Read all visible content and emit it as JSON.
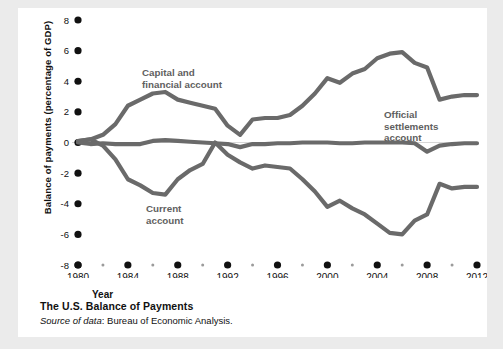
{
  "figure": {
    "caption_title": "The U.S. Balance of Payments",
    "source_lead": "Source of data",
    "source_text": ": Bureau of Economic Analysis."
  },
  "colors": {
    "line": "#6a6a6a",
    "zero_line": "#d7d7d7",
    "text": "#111111",
    "label": "#5f5f5f",
    "page_background": "#ebebeb",
    "card_background": "#ffffff"
  },
  "chart_data": {
    "type": "line",
    "title": "The U.S. Balance of Payments",
    "xlabel": "Year",
    "ylabel": "Balance of payments (percentage of GDP)",
    "xlim": [
      1980,
      2012
    ],
    "ylim": [
      -8,
      8
    ],
    "yticks": [
      8,
      6,
      4,
      2,
      0,
      -2,
      -4,
      -6,
      -8
    ],
    "ytick_labels": [
      "8",
      "6",
      "4",
      "2",
      "0",
      "-2",
      "-4",
      "-6",
      "-8"
    ],
    "xticks": [
      1980,
      1984,
      1988,
      1992,
      1996,
      2000,
      2004,
      2008,
      2012
    ],
    "xtick_labels": [
      "1980",
      "1984",
      "1988",
      "1992",
      "1996",
      "2000",
      "2004",
      "2008",
      "2012"
    ],
    "minor_xticks": [
      1982,
      1986,
      1990,
      1994,
      1998,
      2002,
      2006,
      2010
    ],
    "grid": false,
    "legend": "inline-annotations",
    "x": [
      1980,
      1981,
      1982,
      1983,
      1984,
      1985,
      1986,
      1987,
      1988,
      1989,
      1990,
      1991,
      1992,
      1993,
      1994,
      1995,
      1996,
      1997,
      1998,
      1999,
      2000,
      2001,
      2002,
      2003,
      2004,
      2005,
      2006,
      2007,
      2008,
      2009,
      2010,
      2011,
      2012
    ],
    "series": [
      {
        "name": "Capital and financial account",
        "label_lines": [
          "Capital and",
          "financial account"
        ],
        "values": [
          0.1,
          0.2,
          0.5,
          1.2,
          2.4,
          2.8,
          3.2,
          3.3,
          2.8,
          2.6,
          2.4,
          2.2,
          1.1,
          0.5,
          1.5,
          1.6,
          1.6,
          1.8,
          2.4,
          3.2,
          4.2,
          3.9,
          4.5,
          4.8,
          5.5,
          5.8,
          5.9,
          5.2,
          4.9,
          2.8,
          3.0,
          3.1,
          3.1
        ]
      },
      {
        "name": "Current account",
        "label_lines": [
          "Current",
          "account"
        ],
        "values": [
          0.1,
          0.2,
          -0.2,
          -1.1,
          -2.4,
          -2.8,
          -3.3,
          -3.4,
          -2.4,
          -1.8,
          -1.4,
          0.0,
          -0.8,
          -1.3,
          -1.7,
          -1.5,
          -1.6,
          -1.7,
          -2.4,
          -3.2,
          -4.2,
          -3.8,
          -4.3,
          -4.7,
          -5.3,
          -5.9,
          -6.0,
          -5.1,
          -4.7,
          -2.7,
          -3.0,
          -2.9,
          -2.9
        ]
      },
      {
        "name": "Official settlements account",
        "label_lines": [
          "Official",
          "settlements",
          "account"
        ],
        "values": [
          0.0,
          -0.1,
          -0.05,
          -0.1,
          -0.1,
          -0.1,
          0.1,
          0.15,
          0.1,
          0.05,
          0.0,
          -0.05,
          -0.1,
          -0.3,
          -0.1,
          -0.1,
          -0.05,
          -0.05,
          0.0,
          0.0,
          0.0,
          -0.05,
          -0.05,
          0.0,
          0.0,
          0.0,
          0.0,
          -0.05,
          -0.6,
          -0.2,
          -0.1,
          -0.05,
          -0.05
        ]
      }
    ]
  }
}
